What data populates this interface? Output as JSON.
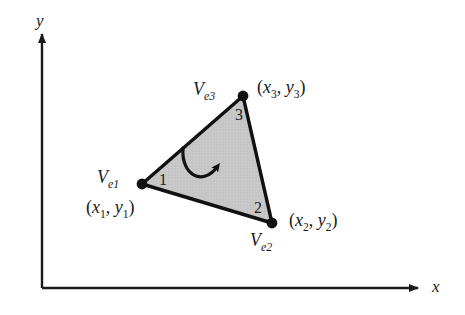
{
  "figure": {
    "type": "diagram",
    "title": "",
    "background_color": "#ffffff",
    "ink_color": "#1a1a1a",
    "fill_color": "#c8c8c8"
  },
  "axes": {
    "x_label": "x",
    "y_label": "y",
    "origin": {
      "x": 42,
      "y": 288
    },
    "x_axis_end": {
      "x": 424,
      "y": 288
    },
    "y_axis_end": {
      "x": 42,
      "y": 30
    },
    "arrowheads": true,
    "grid": false
  },
  "element": {
    "shape": "triangle",
    "fill": "#c8c8c8",
    "stroke": "#111111",
    "stroke_width": 3,
    "orientation_arrow": {
      "name": "counterclockwise-arrow",
      "direction": "counterclockwise"
    },
    "vertices": [
      {
        "id": "v1",
        "node_number": "1",
        "vertex_label": "V",
        "vertex_subscript": "e1",
        "coord_open": "(",
        "coord_x": "x",
        "coord_x_sub": "1",
        "coord_sep": ", ",
        "coord_y": "y",
        "coord_y_sub": "1",
        "coord_close": ")",
        "px": {
          "x": 142,
          "y": 184
        }
      },
      {
        "id": "v2",
        "node_number": "2",
        "vertex_label": "V",
        "vertex_subscript": "e2",
        "coord_open": "(",
        "coord_x": "x",
        "coord_x_sub": "2",
        "coord_sep": ", ",
        "coord_y": "y",
        "coord_y_sub": "2",
        "coord_close": ")",
        "px": {
          "x": 272,
          "y": 223
        }
      },
      {
        "id": "v3",
        "node_number": "3",
        "vertex_label": "V",
        "vertex_subscript": "e3",
        "coord_open": "(",
        "coord_x": "x",
        "coord_x_sub": "3",
        "coord_sep": ", ",
        "coord_y": "y",
        "coord_y_sub": "3",
        "coord_close": ")",
        "px": {
          "x": 243,
          "y": 96
        }
      }
    ]
  }
}
